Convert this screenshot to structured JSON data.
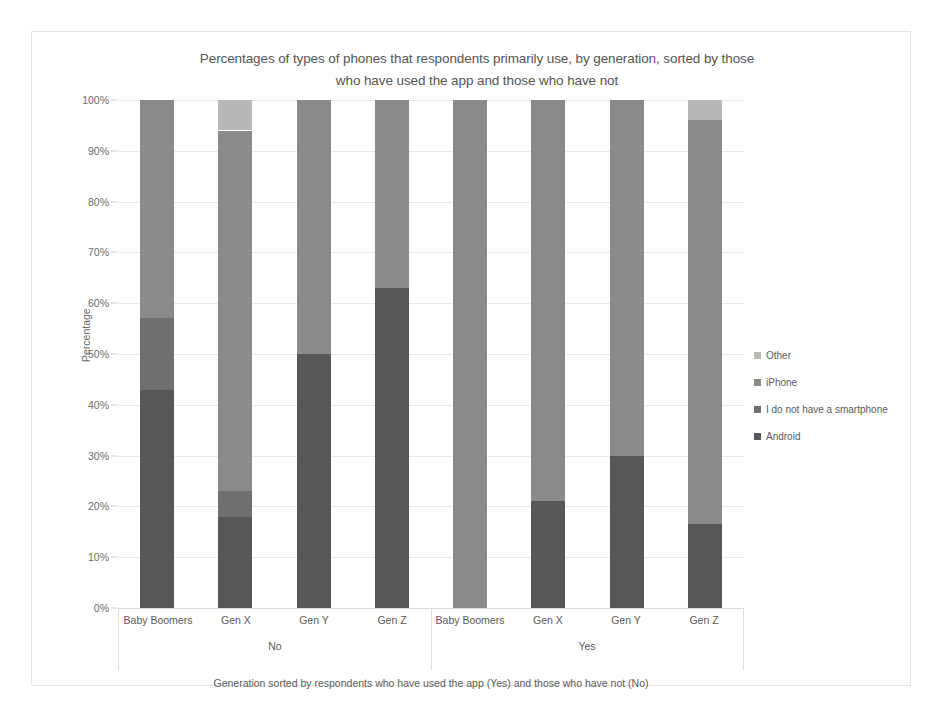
{
  "chart_data": {
    "type": "bar",
    "subtype": "stacked-100-percent",
    "title": "Percentages of types of phones that respondents primarily use, by generation, sorted by those who have used the app and those who have not",
    "title_lines": [
      "Percentages of types of phones that respondents primarily use, by generation, sorted by those",
      "who have used the app and those who have not"
    ],
    "xlabel": "Generation sorted by respondents who have used the app (Yes) and those who have not (No)",
    "ylabel": "Percentage",
    "ylim": [
      0,
      100
    ],
    "ytick_labels": [
      "0%",
      "10%",
      "20%",
      "30%",
      "40%",
      "50%",
      "60%",
      "70%",
      "80%",
      "90%",
      "100%"
    ],
    "ytick_values": [
      0,
      10,
      20,
      30,
      40,
      50,
      60,
      70,
      80,
      90,
      100
    ],
    "grid": true,
    "legend_position": "right",
    "categories": [
      "Baby Boomers",
      "Gen X",
      "Gen Y",
      "Gen Z",
      "Baby Boomers",
      "Gen X",
      "Gen Y",
      "Gen Z"
    ],
    "groups": [
      {
        "label": "No",
        "categories": [
          "Baby Boomers",
          "Gen X",
          "Gen Y",
          "Gen Z"
        ]
      },
      {
        "label": "Yes",
        "categories": [
          "Baby Boomers",
          "Gen X",
          "Gen Y",
          "Gen Z"
        ]
      }
    ],
    "series": [
      {
        "name": "Android",
        "color": "#575757",
        "values": [
          43,
          18,
          50,
          63,
          0,
          21,
          30,
          16.5
        ]
      },
      {
        "name": "I do not have a smartphone",
        "color": "#6f6f6f",
        "values": [
          14,
          5,
          0,
          0,
          0,
          0,
          0,
          0
        ]
      },
      {
        "name": "iPhone",
        "color": "#8a8a8a",
        "values": [
          43,
          71,
          50,
          37,
          100,
          79,
          70,
          79.5
        ]
      },
      {
        "name": "Other",
        "color": "#b8b8b8",
        "values": [
          0,
          6,
          0,
          0,
          0,
          0,
          0,
          4
        ]
      }
    ],
    "legend_entries": [
      {
        "label": "Other",
        "color": "#b8b8b8"
      },
      {
        "label": "iPhone",
        "color": "#8a8a8a"
      },
      {
        "label": "I do not have a smartphone",
        "color": "#6f6f6f"
      },
      {
        "label": "Android",
        "color": "#575757"
      }
    ]
  }
}
